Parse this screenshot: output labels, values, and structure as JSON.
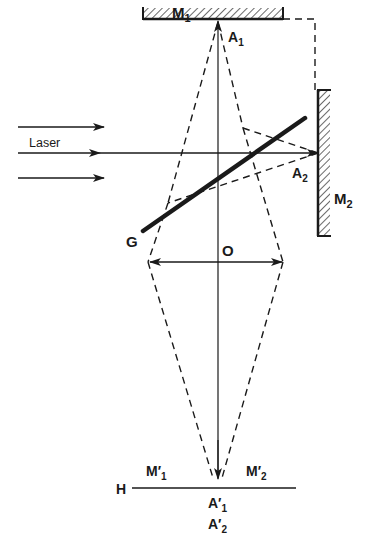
{
  "diagram": {
    "type": "optics",
    "labels": {
      "mirror1": "M",
      "mirror1_sub": "1",
      "point_a1": "A",
      "point_a1_sub": "1",
      "mirror2": "M",
      "mirror2_sub": "2",
      "point_a2": "A",
      "point_a2_sub": "2",
      "laser": "Laser",
      "beamsplitter": "G",
      "lens": "O",
      "screen": "H",
      "image_m1": "M′",
      "image_m1_sub": "1",
      "image_m2": "M′",
      "image_m2_sub": "2",
      "image_a1": "A′",
      "image_a1_sub": "1",
      "image_a2": "A′",
      "image_a2_sub": "2"
    },
    "colors": {
      "ink": "#1a1a1a",
      "background": "#ffffff"
    },
    "elements": [
      {
        "id": "M1",
        "kind": "mirror",
        "orientation": "horizontal"
      },
      {
        "id": "M2",
        "kind": "mirror",
        "orientation": "vertical"
      },
      {
        "id": "G",
        "kind": "beam-splitter",
        "orientation": "diagonal"
      },
      {
        "id": "O",
        "kind": "lens",
        "orientation": "horizontal"
      },
      {
        "id": "H",
        "kind": "screen/plane",
        "orientation": "horizontal"
      },
      {
        "id": "Laser",
        "kind": "source",
        "rays": 3
      }
    ]
  }
}
